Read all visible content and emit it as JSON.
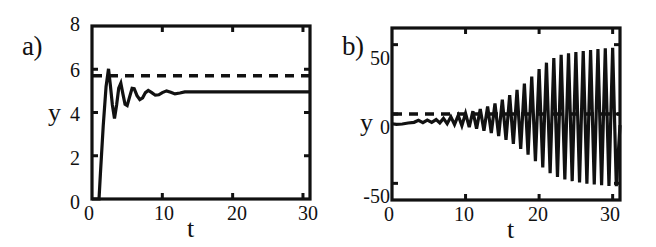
{
  "figure": {
    "background_color": "#ffffff",
    "ink_color": "#111111"
  },
  "panels": [
    {
      "tag": "a)",
      "xlabel": "t",
      "ylabel": "y",
      "xticks": [
        "0",
        "10",
        "20",
        "30"
      ],
      "yticks": [
        "0",
        "2",
        "4",
        "6",
        "8"
      ]
    },
    {
      "tag": "b)",
      "xlabel": "t",
      "ylabel": "y",
      "xticks": [
        "0",
        "10",
        "20",
        "30"
      ],
      "yticks": [
        "-50",
        "0",
        "50"
      ]
    }
  ],
  "chart_data": [
    {
      "type": "line",
      "title": "a)",
      "xlabel": "t",
      "ylabel": "y",
      "xlim": [
        0,
        31
      ],
      "ylim": [
        0,
        8
      ],
      "xticks": [
        0,
        10,
        20,
        30
      ],
      "yticks": [
        0,
        2,
        4,
        6,
        8
      ],
      "grid": false,
      "legend": "none",
      "series": [
        {
          "name": "y(t) damped approach to steady state",
          "style": "solid",
          "x": [
            0.0,
            1.0,
            1.2,
            1.6,
            2.0,
            2.35,
            2.6,
            2.9,
            3.2,
            3.5,
            3.8,
            4.1,
            4.4,
            4.7,
            5.0,
            5.35,
            5.7,
            6.0,
            6.4,
            6.8,
            7.2,
            7.6,
            8.0,
            8.5,
            9.0,
            9.5,
            10.0,
            10.6,
            11.2,
            11.8,
            12.5,
            13.2,
            14.0,
            16.0,
            18.0,
            20.0,
            24.0,
            27.0,
            31.0
          ],
          "y": [
            0.0,
            0.0,
            1.2,
            3.4,
            5.2,
            6.02,
            5.3,
            4.35,
            3.72,
            4.35,
            5.12,
            5.35,
            4.85,
            4.38,
            4.32,
            4.72,
            5.12,
            5.1,
            4.78,
            4.6,
            4.68,
            4.92,
            5.02,
            4.92,
            4.8,
            4.82,
            4.92,
            5.0,
            4.94,
            4.86,
            4.9,
            4.95,
            4.96,
            4.95,
            4.95,
            4.95,
            4.95,
            4.95,
            4.95
          ]
        },
        {
          "name": "reference level",
          "style": "dashed",
          "value": 5.7
        }
      ],
      "annotations": {
        "steady_state": 4.95,
        "overshoot_peak": 6.02,
        "first_undershoot": 3.72,
        "dashed_reference": 5.7,
        "onset_time": 1.0
      }
    },
    {
      "type": "line",
      "title": "b)",
      "xlabel": "t",
      "ylabel": "y",
      "xlim": [
        0,
        31
      ],
      "ylim": [
        -62,
        62
      ],
      "xticks": [
        0,
        10,
        20,
        30
      ],
      "yticks": [
        -50,
        0,
        50
      ],
      "grid": false,
      "legend": "none",
      "series": [
        {
          "name": "y(t) growing oscillation",
          "style": "solid",
          "x": [
            0.0,
            0.6,
            1.4,
            2.2,
            3.0,
            3.6,
            4.2,
            4.8,
            5.4,
            6.0,
            6.5,
            7.0,
            7.5,
            8.0,
            8.5,
            9.0,
            9.5,
            10.0,
            10.5,
            11.0,
            11.5,
            12.0,
            12.5,
            13.0,
            13.5,
            14.0,
            14.5,
            15.0,
            15.5,
            16.0,
            16.5,
            17.0,
            17.5,
            18.0,
            18.5,
            19.0,
            19.5,
            20.0,
            20.5,
            21.0,
            21.5,
            22.0,
            22.5,
            23.0,
            23.5,
            24.0,
            24.5,
            25.0,
            25.5,
            26.0,
            26.5,
            27.0,
            27.5,
            28.0,
            28.5,
            29.0,
            29.5,
            30.0,
            30.5,
            31.0
          ],
          "y": [
            -7.0,
            -7.5,
            -7.2,
            -6.5,
            -6.0,
            -4.6,
            -6.2,
            -4.4,
            -6.0,
            -4.0,
            -6.4,
            -3.2,
            -7.0,
            -2.0,
            -7.6,
            -1.0,
            -8.4,
            0.5,
            -9.4,
            2.0,
            -10.6,
            3.6,
            -12.0,
            5.4,
            -13.8,
            7.6,
            -16.0,
            10.4,
            -18.6,
            13.6,
            -21.6,
            17.4,
            -25.2,
            22.0,
            -29.4,
            27.0,
            -34.0,
            32.4,
            -38.6,
            37.0,
            -42.6,
            40.4,
            -45.4,
            42.6,
            -47.2,
            43.8,
            -48.4,
            44.6,
            -49.4,
            45.4,
            -50.2,
            46.2,
            -50.8,
            46.8,
            -51.4,
            47.4,
            -51.8,
            47.8,
            -52.0,
            -8.0
          ]
        },
        {
          "name": "reference level",
          "style": "dashed",
          "value": 0
        }
      ],
      "annotations": {
        "initial_value": -7.0,
        "final_peak": 48,
        "final_trough": -52,
        "dashed_reference": 0,
        "growth": "exponentially growing limit-cycle oscillation"
      }
    }
  ]
}
